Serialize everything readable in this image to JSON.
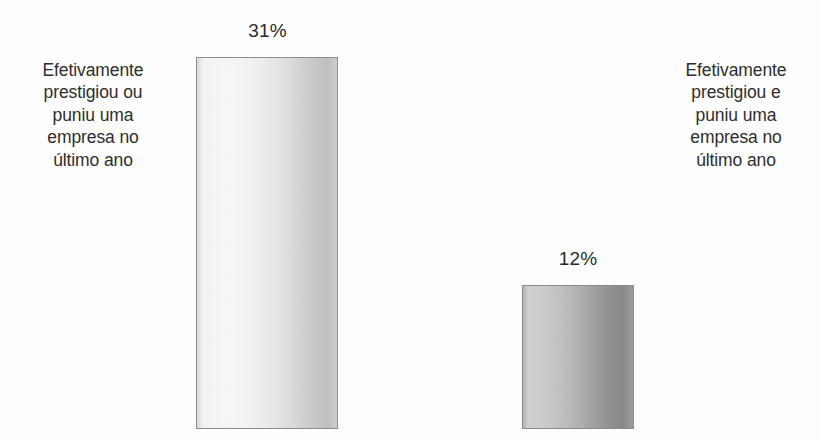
{
  "chart_data": {
    "type": "bar",
    "title": "",
    "subtitle": "",
    "xlabel": "",
    "ylabel": "",
    "categories": [
      "Efetivamente prestigiou ou puniu uma empresa no último ano",
      "Efetivamente prestigiou e puniu uma empresa no último ano"
    ],
    "values": [
      31,
      12
    ],
    "value_labels": [
      "31%",
      "12%"
    ],
    "unit": "%",
    "ylim": [
      0,
      36
    ],
    "grid": false,
    "legend": "none",
    "axis_visible": false,
    "orientation": "vertical",
    "series": [
      {
        "name": "",
        "values": [
          31,
          12
        ]
      }
    ]
  },
  "labels": {
    "left_category": "Efetivamente\nprestigiou ou\npuniu uma\nempresa no\núltimo ano",
    "right_category": "Efetivamente\nprestigiou e\npuniu uma\nempresa no\núltimo ano",
    "left_value": "31%",
    "right_value": "12%"
  },
  "colors": {
    "background": "#fdfdfd",
    "text": "#2e2e2e",
    "bar_left_fill": "#f0f0f0",
    "bar_left_border": "#8d8d8d",
    "bar_right_fill": "#b0b0b0",
    "bar_right_border": "#8a8a8a"
  }
}
